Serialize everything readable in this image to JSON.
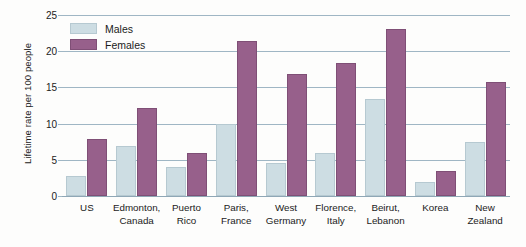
{
  "chart_data": {
    "type": "bar",
    "title": "",
    "xlabel": "",
    "ylabel": "Lifetime rate per 100 people",
    "ylim": [
      0,
      25
    ],
    "yticks": [
      0,
      5,
      10,
      15,
      20,
      25
    ],
    "ytick_labels": [
      "0",
      "5",
      "10",
      "15",
      "20",
      "25"
    ],
    "grid": true,
    "legend_position": "top-left",
    "categories": [
      "US",
      "Edmonton, Canada",
      "Puerto Rico",
      "Paris, France",
      "West Germany",
      "Florence, Italy",
      "Beirut, Lebanon",
      "Korea",
      "New Zealand"
    ],
    "category_lines": [
      [
        "US",
        ""
      ],
      [
        "Edmonton,",
        "Canada"
      ],
      [
        "Puerto",
        "Rico"
      ],
      [
        "Paris,",
        "France"
      ],
      [
        "West",
        "Germany"
      ],
      [
        "Florence,",
        "Italy"
      ],
      [
        "Beirut,",
        "Lebanon"
      ],
      [
        "Korea",
        ""
      ],
      [
        "New",
        "Zealand"
      ]
    ],
    "series": [
      {
        "name": "Males",
        "color": "#cddde3",
        "values": [
          2.8,
          6.9,
          4.0,
          10.0,
          4.5,
          5.9,
          13.4,
          2.0,
          7.5
        ]
      },
      {
        "name": "Females",
        "color": "#97608b",
        "values": [
          7.9,
          12.2,
          5.9,
          21.4,
          16.8,
          18.4,
          23.1,
          3.5,
          15.8
        ]
      }
    ]
  },
  "legend": {
    "items": [
      {
        "label": "Males",
        "key": "male"
      },
      {
        "label": "Females",
        "key": "female"
      }
    ]
  },
  "colors": {
    "male": "#cddde3",
    "female": "#97608b",
    "gridline": "#9fb6c4",
    "text": "#1b1b1b",
    "background": "#fdfdfc"
  }
}
